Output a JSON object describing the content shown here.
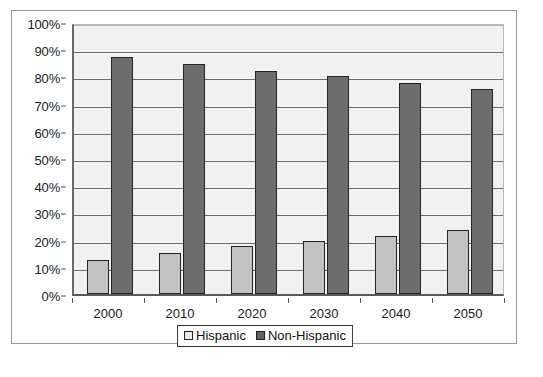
{
  "chart_data": {
    "type": "bar",
    "title": "",
    "xlabel": "",
    "ylabel": "",
    "ylim": [
      0,
      100
    ],
    "ytick_labels": [
      "100%",
      "90%",
      "80%",
      "70%",
      "60%",
      "50%",
      "40%",
      "30%",
      "20%",
      "10%",
      "0%"
    ],
    "ytick_values": [
      100,
      90,
      80,
      70,
      60,
      50,
      40,
      30,
      20,
      10,
      0
    ],
    "grid": true,
    "legend_position": "bottom-center",
    "categories": [
      "2000",
      "2010",
      "2020",
      "2030",
      "2040",
      "2050"
    ],
    "series": [
      {
        "name": "Hispanic",
        "color": "#c2c2c2",
        "values": [
          12.5,
          15,
          17.5,
          19.5,
          21.5,
          23.5
        ]
      },
      {
        "name": "Non-Hispanic",
        "color": "#6e6e6e",
        "values": [
          87,
          84.5,
          82,
          80,
          77.5,
          75.5
        ]
      }
    ]
  },
  "legend": {
    "entries": [
      {
        "label": "Hispanic",
        "swatch": "hispanic"
      },
      {
        "label": "Non-Hispanic",
        "swatch": "nonhispanic"
      }
    ]
  }
}
